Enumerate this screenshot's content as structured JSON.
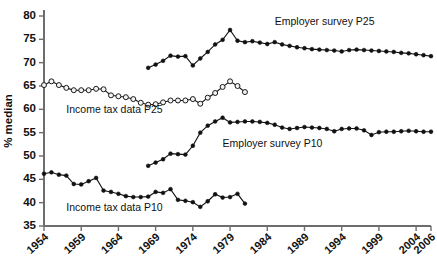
{
  "chart_data": {
    "type": "line",
    "title": "",
    "xlabel": "",
    "ylabel": "% median",
    "xlim": [
      1954,
      2006
    ],
    "ylim": [
      35,
      80
    ],
    "ytick_values": [
      35,
      40,
      45,
      50,
      55,
      60,
      65,
      70,
      75,
      80
    ],
    "ytick_labels": [
      "35",
      "40",
      "45",
      "50",
      "55",
      "60",
      "65",
      "70",
      "75",
      "80"
    ],
    "xtick_values": [
      1954,
      1959,
      1964,
      1969,
      1974,
      1979,
      1984,
      1989,
      1994,
      1999,
      2004,
      2006
    ],
    "xtick_labels": [
      "1954",
      "1959",
      "1964",
      "1969",
      "1974",
      "1979",
      "1984",
      "1989",
      "1994",
      "1999",
      "2004",
      "2006"
    ],
    "grid": false,
    "legend_position": "inline-annotations",
    "series": [
      {
        "name": "Income tax data P25",
        "marker": "open-circle",
        "annotation": "Income tax data P25",
        "annotation_x": 1957.0,
        "annotation_y": 59.3,
        "x": [
          1954,
          1955,
          1956,
          1957,
          1958,
          1959,
          1960,
          1961,
          1962,
          1963,
          1964,
          1965,
          1966,
          1967,
          1968,
          1969,
          1970,
          1971,
          1972,
          1973,
          1974,
          1975,
          1976,
          1977,
          1978,
          1979,
          1980,
          1981
        ],
        "y": [
          65.2,
          66.0,
          65.2,
          64.6,
          64.1,
          64.1,
          64.1,
          64.4,
          64.3,
          63.0,
          62.8,
          62.6,
          62.2,
          61.4,
          61.0,
          61.1,
          61.5,
          61.9,
          61.9,
          61.9,
          62.2,
          61.2,
          62.5,
          63.5,
          64.8,
          66.0,
          65.0,
          63.7
        ]
      },
      {
        "name": "Income tax data P10",
        "marker": "filled-circle",
        "annotation": "Income tax data P10",
        "annotation_x": 1957.0,
        "annotation_y": 38.3,
        "x": [
          1954,
          1955,
          1956,
          1957,
          1958,
          1959,
          1960,
          1961,
          1962,
          1963,
          1964,
          1965,
          1966,
          1967,
          1968,
          1969,
          1970,
          1971,
          1972,
          1973,
          1974,
          1975,
          1976,
          1977,
          1978,
          1979,
          1980,
          1981
        ],
        "y": [
          46.2,
          46.5,
          46.0,
          45.8,
          44.0,
          43.9,
          44.6,
          45.3,
          42.6,
          42.3,
          41.9,
          41.4,
          41.2,
          41.2,
          41.3,
          42.3,
          42.1,
          42.9,
          40.6,
          40.4,
          40.1,
          39.1,
          40.3,
          41.8,
          41.1,
          41.2,
          41.9,
          39.8
        ]
      },
      {
        "name": "Employer survey P25",
        "marker": "filled-circle",
        "annotation": "Employer survey P25",
        "annotation_x": 1985.0,
        "annotation_y": 78.0,
        "x": [
          1968,
          1969,
          1970,
          1971,
          1972,
          1973,
          1974,
          1975,
          1976,
          1977,
          1978,
          1979,
          1980,
          1981,
          1982,
          1983,
          1984,
          1985,
          1986,
          1987,
          1988,
          1989,
          1990,
          1991,
          1992,
          1993,
          1994,
          1995,
          1996,
          1997,
          1998,
          1999,
          2000,
          2001,
          2002,
          2003,
          2004,
          2005,
          2006
        ],
        "y": [
          68.9,
          69.6,
          70.4,
          71.5,
          71.3,
          71.4,
          69.4,
          70.9,
          72.3,
          73.9,
          74.9,
          77.0,
          74.7,
          74.4,
          74.6,
          74.3,
          74.0,
          74.4,
          73.9,
          73.6,
          73.3,
          73.1,
          72.9,
          72.8,
          72.7,
          72.6,
          72.4,
          72.7,
          72.8,
          72.7,
          72.6,
          72.5,
          72.4,
          72.3,
          72.1,
          72.0,
          71.8,
          71.6,
          71.4
        ]
      },
      {
        "name": "Employer survey P10",
        "marker": "filled-circle",
        "annotation": "Employer survey P10",
        "annotation_x": 1978.0,
        "annotation_y": 52.0,
        "x": [
          1968,
          1969,
          1970,
          1971,
          1972,
          1973,
          1974,
          1975,
          1976,
          1977,
          1978,
          1979,
          1980,
          1981,
          1982,
          1983,
          1984,
          1985,
          1986,
          1987,
          1988,
          1989,
          1990,
          1991,
          1992,
          1993,
          1994,
          1995,
          1996,
          1997,
          1998,
          1999,
          2000,
          2001,
          2002,
          2003,
          2004,
          2005,
          2006
        ],
        "y": [
          47.9,
          48.6,
          49.3,
          50.5,
          50.4,
          50.3,
          52.2,
          55.0,
          56.5,
          57.4,
          58.2,
          57.2,
          57.3,
          57.4,
          57.4,
          57.3,
          57.1,
          56.7,
          56.1,
          55.8,
          56.0,
          56.2,
          56.1,
          56.0,
          55.8,
          55.3,
          55.8,
          55.9,
          55.9,
          55.5,
          54.5,
          55.1,
          55.2,
          55.2,
          55.3,
          55.4,
          55.3,
          55.2,
          55.2
        ]
      }
    ]
  }
}
